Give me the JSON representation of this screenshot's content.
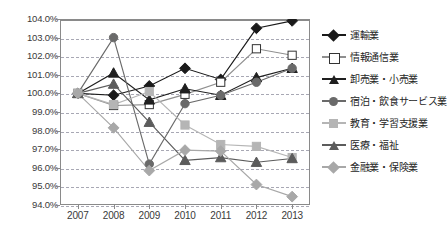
{
  "chart_data": {
    "type": "line",
    "title": "",
    "subtitle": "",
    "xlabel": "",
    "ylabel": "",
    "categories": [
      "2007",
      "2008",
      "2009",
      "2010",
      "2011",
      "2012",
      "2013"
    ],
    "x": [
      2007,
      2008,
      2009,
      2010,
      2011,
      2012,
      2013
    ],
    "ylim": [
      94.0,
      104.0
    ],
    "ytick_values": [
      104.0,
      103.0,
      102.0,
      101.0,
      100.0,
      99.0,
      98.0,
      97.0,
      96.0,
      95.0,
      94.0
    ],
    "ytick_labels": [
      "104.0%",
      "103.0%",
      "102.0%",
      "101.0%",
      "100.0%",
      "99.0%",
      "98.0%",
      "97.0%",
      "96.0%",
      "95.0%",
      "94.0%"
    ],
    "grid": true,
    "grid_style": "horizontal-dashed",
    "legend_position": "right",
    "series": [
      {
        "name": "運輸業",
        "marker": "diamond",
        "marker_fill": "#1a1a1a",
        "line_color": "#1a1a1a",
        "values": [
          100.0,
          99.9,
          100.4,
          101.35,
          100.75,
          103.5,
          103.9
        ]
      },
      {
        "name": "情報通信業",
        "marker": "square",
        "marker_fill": "#ffffff",
        "line_color": "#8f8f8f",
        "values": [
          100.0,
          99.35,
          99.4,
          99.95,
          100.6,
          102.4,
          102.05
        ]
      },
      {
        "name": "卸売業・小売業",
        "marker": "triangle",
        "marker_fill": "#1f1f1f",
        "line_color": "#1f1f1f",
        "values": [
          100.0,
          101.1,
          99.65,
          100.25,
          99.9,
          100.85,
          101.35
        ]
      },
      {
        "name": "宿泊・飲食サービス業",
        "marker": "circle",
        "marker_fill": "#6a6a6a",
        "line_color": "#6a6a6a",
        "values": [
          100.0,
          103.0,
          96.2,
          99.45,
          99.9,
          100.6,
          101.35
        ]
      },
      {
        "name": "教育・学習支援業",
        "marker": "square",
        "marker_fill": "#b5b5b5",
        "line_color": "#b5b5b5",
        "values": [
          100.0,
          99.4,
          100.1,
          98.3,
          97.25,
          97.15,
          96.55
        ]
      },
      {
        "name": "医療・福祉",
        "marker": "triangle",
        "marker_fill": "#5c5c5c",
        "line_color": "#5c5c5c",
        "values": [
          100.0,
          100.5,
          98.45,
          96.4,
          96.55,
          96.3,
          96.5
        ]
      },
      {
        "name": "金融業・保険業",
        "marker": "diamond",
        "marker_fill": "#a8a8a8",
        "line_color": "#a8a8a8",
        "values": [
          100.0,
          98.15,
          95.85,
          96.95,
          96.9,
          95.1,
          94.45
        ]
      }
    ]
  },
  "legend": {
    "items": [
      {
        "label": "運輸業"
      },
      {
        "label": "情報通信業"
      },
      {
        "label": "卸売業・小売業"
      },
      {
        "label": "宿泊・飲食サービス業"
      },
      {
        "label": "教育・学習支援業"
      },
      {
        "label": "医療・福祉"
      },
      {
        "label": "金融業・保険業"
      }
    ]
  },
  "colors": {
    "frame": "#8a8a8a",
    "grid": "#9a9aa8",
    "text": "#2b2b2b",
    "background": "#ffffff"
  }
}
